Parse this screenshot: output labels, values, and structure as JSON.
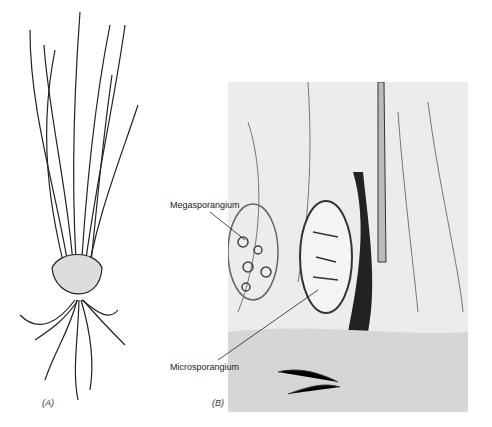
{
  "figure": {
    "panels": [
      {
        "id": "A",
        "label": "(A)",
        "subject": "whole plant drawing with grass-like leaves, corm and roots"
      },
      {
        "id": "B",
        "label": "(B)",
        "subject": "longitudinal section micrograph"
      }
    ],
    "annotations": [
      {
        "text": "Megasporangium",
        "panel": "B"
      },
      {
        "text": "Microsporangium",
        "panel": "B"
      }
    ],
    "colors": {
      "ink": "#222222",
      "background": "#ffffff",
      "micrograph_bg": "#e8e8e8"
    }
  }
}
